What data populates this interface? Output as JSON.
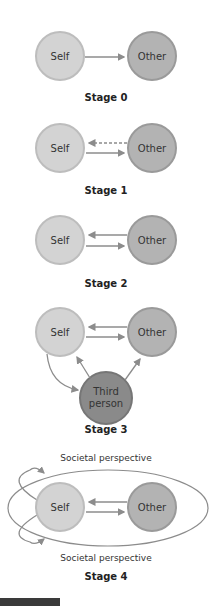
{
  "nodes": {
    "self": "Self",
    "other": "Other",
    "third_line1": "Third",
    "third_line2": "person"
  },
  "stages": [
    {
      "label": "Stage 0"
    },
    {
      "label": "Stage 1"
    },
    {
      "label": "Stage 2"
    },
    {
      "label": "Stage 3",
      "perspective": "Societal perspective"
    },
    {
      "label": "Stage 4",
      "perspective_top": "Societal perspective",
      "perspective_bottom": "Societal perspective"
    }
  ],
  "colors": {
    "self": "#d3d3d3",
    "other": "#b3b3b3",
    "third": "#8a8a8a",
    "arrow": "#8c8c8c",
    "rim": "#9a9a9a"
  }
}
